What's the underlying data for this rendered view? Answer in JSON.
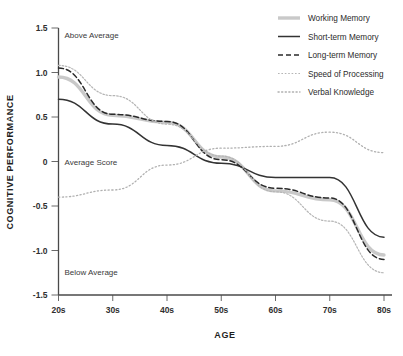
{
  "chart_data": {
    "type": "line",
    "title": "",
    "xlabel": "AGE",
    "ylabel": "COGNITIVE PERFORMANCE",
    "categories": [
      "20s",
      "30s",
      "40s",
      "50s",
      "60s",
      "70s",
      "80s"
    ],
    "ylim": [
      -1.5,
      1.5
    ],
    "yticks": [
      1.5,
      1.0,
      0.5,
      0,
      -0.5,
      -1.0,
      -1.5
    ],
    "ytick_labels": [
      "1.5",
      "1.0",
      "0.5",
      "0",
      "-0.5",
      "-1.0",
      "-1.5"
    ],
    "grid": false,
    "legend_position": "top-right",
    "annotations": [
      {
        "text": "Above Average",
        "x_category": "20s",
        "y": 1.42
      },
      {
        "text": "Average Score",
        "x_category": "20s",
        "y": 0.0
      },
      {
        "text": "Below Average",
        "x_category": "20s",
        "y": -1.24
      }
    ],
    "series": [
      {
        "name": "Working Memory",
        "style": "thick-solid-gray",
        "color": "#c9c9c9",
        "width": 3.4,
        "dash": "none",
        "values": [
          0.95,
          0.52,
          0.44,
          0.05,
          -0.33,
          -0.43,
          -1.05
        ]
      },
      {
        "name": "Short-term Memory",
        "style": "solid",
        "color": "#333333",
        "width": 1.5,
        "dash": "none",
        "values": [
          0.7,
          0.42,
          0.18,
          -0.02,
          -0.18,
          -0.18,
          -0.85
        ]
      },
      {
        "name": "Long-term Memory",
        "style": "dashed",
        "color": "#2a2a2a",
        "width": 1.5,
        "dash": "5,3",
        "values": [
          1.05,
          0.53,
          0.45,
          0.02,
          -0.3,
          -0.41,
          -1.1
        ]
      },
      {
        "name": "Speed of Processing",
        "style": "dotted",
        "color": "#b5b5b5",
        "width": 1.2,
        "dash": "1.6,1.8",
        "values": [
          1.08,
          0.74,
          0.42,
          0.06,
          -0.34,
          -0.67,
          -1.25
        ]
      },
      {
        "name": "Verbal Knowledge",
        "style": "circle-dotted",
        "color": "#b0b0b0",
        "width": 1.3,
        "dash": "1.2,2.4",
        "values": [
          -0.4,
          -0.32,
          -0.04,
          0.15,
          0.17,
          0.33,
          0.1
        ]
      }
    ]
  },
  "legend": {
    "items": [
      {
        "label": "Working Memory"
      },
      {
        "label": "Short-term Memory"
      },
      {
        "label": "Long-term Memory"
      },
      {
        "label": "Speed of Processing"
      },
      {
        "label": "Verbal Knowledge"
      }
    ]
  },
  "caption": {
    "text": ""
  }
}
